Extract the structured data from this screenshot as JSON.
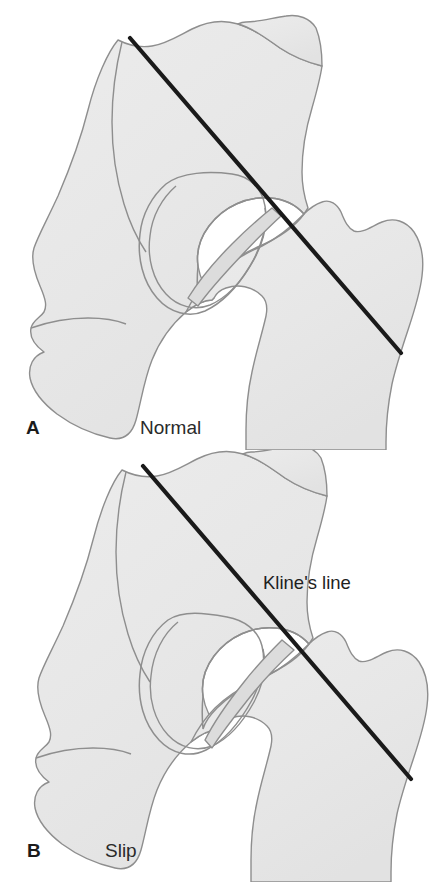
{
  "figure": {
    "background_color": "#ffffff",
    "bone_fill_color": "#e9e9e9",
    "bone_outline_color": "#8c8c8c",
    "line_color": "#1a1a1a"
  },
  "panels": [
    {
      "id": "normal",
      "letter": "A",
      "caption": "Normal",
      "description": "Kline's line drawn along the superior border of the femoral neck intersects the lateral portion of the capital femoral epiphysis.",
      "kline_line": {
        "x1": 130,
        "y1": 38,
        "x2": 401,
        "y2": 353
      }
    },
    {
      "id": "slip",
      "letter": "B",
      "caption": "Slip",
      "description": "With a slipped capital femoral epiphysis, Kline's line passes superior to the epiphysis and fails to intersect it.",
      "kline_line": {
        "x1": 143,
        "y1": 466,
        "x2": 411,
        "y2": 779
      },
      "annotation": "Kline's line"
    }
  ],
  "labels": {
    "kline_line": "Kline's line"
  }
}
